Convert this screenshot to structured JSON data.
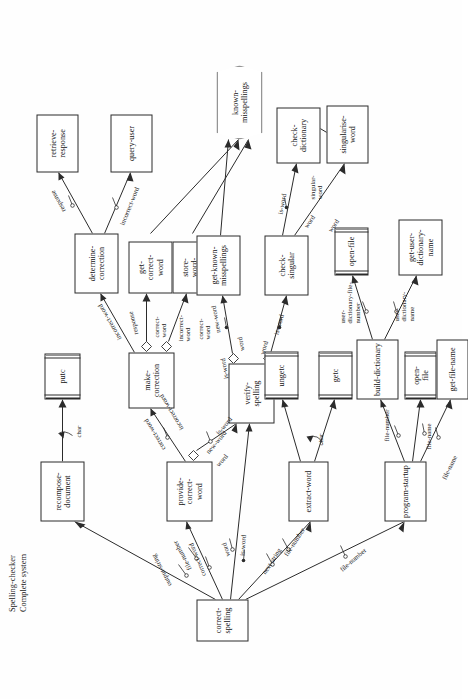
{
  "title": {
    "line1": "Spelling-checker",
    "line2": "Complete system"
  },
  "diagram": {
    "type": "structure-chart",
    "notation": "Yourdon/Constantine structure chart, rotated 90 degrees (landscape drawing on portrait page)",
    "root": "correct-spelling",
    "nodes": [
      {
        "id": "correct-spelling",
        "label": "correct-spelling",
        "kind": "module"
      },
      {
        "id": "recompose-document",
        "label": "recompose-\ndocument",
        "kind": "module"
      },
      {
        "id": "putc",
        "label": "putc",
        "kind": "library"
      },
      {
        "id": "provide-correct-word",
        "label": "provide-\ncorrect-\nword",
        "kind": "module"
      },
      {
        "id": "make-correction",
        "label": "make-\ncorrection",
        "kind": "module"
      },
      {
        "id": "determine-correction",
        "label": "determine-\ncorrection",
        "kind": "module"
      },
      {
        "id": "retrieve-response",
        "label": "retrieve-\nresponse",
        "kind": "module"
      },
      {
        "id": "query-user",
        "label": "query-user",
        "kind": "module"
      },
      {
        "id": "get-correct-word",
        "label": "get-\ncorrect-\nword",
        "kind": "module"
      },
      {
        "id": "store-word-pair",
        "label": "store-\nword-\npair",
        "kind": "module"
      },
      {
        "id": "verify-spelling",
        "label": "verify-\nspelling",
        "kind": "module"
      },
      {
        "id": "get-known-misspellings",
        "label": "get-known-\nmisspellings",
        "kind": "module"
      },
      {
        "id": "known-misspellings",
        "label": "known-\nmisspellings",
        "kind": "datastore"
      },
      {
        "id": "check-singular",
        "label": "check-\nsingular",
        "kind": "module"
      },
      {
        "id": "check-dictionary",
        "label": "check-\ndictionary",
        "kind": "module"
      },
      {
        "id": "singularise-word",
        "label": "singularise-\nword",
        "kind": "module"
      },
      {
        "id": "extract-word",
        "label": "extract-word",
        "kind": "module"
      },
      {
        "id": "ungetc",
        "label": "ungetc",
        "kind": "library"
      },
      {
        "id": "getc",
        "label": "getc",
        "kind": "library"
      },
      {
        "id": "program-startup",
        "label": "program-startup",
        "kind": "module"
      },
      {
        "id": "build-dictionary",
        "label": "build-dictionary",
        "kind": "module"
      },
      {
        "id": "open-file",
        "label": "open-\nfile",
        "kind": "library"
      },
      {
        "id": "open-dictionary",
        "label": "open-file",
        "kind": "library"
      },
      {
        "id": "get-user-dictionary-name",
        "label": "get-user-\ndictionary-\nname",
        "kind": "module"
      },
      {
        "id": "get-file-name",
        "label": "get-file-name",
        "kind": "module"
      }
    ],
    "edges": [
      {
        "from": "correct-spelling",
        "to": "recompose-document",
        "labels": [
          "output-string",
          "file-number"
        ]
      },
      {
        "from": "correct-spelling",
        "to": "provide-correct-word",
        "labels": [
          "correct-word",
          "word"
        ]
      },
      {
        "from": "correct-spelling",
        "to": "verify-spelling",
        "labels": [
          "is-word",
          "word"
        ]
      },
      {
        "from": "correct-spelling",
        "to": "extract-word",
        "labels": [
          "next-string",
          "file-number"
        ]
      },
      {
        "from": "correct-spelling",
        "to": "program-startup",
        "labels": [
          "file-number"
        ]
      },
      {
        "from": "recompose-document",
        "to": "putc",
        "labels": [
          "char"
        ]
      },
      {
        "from": "provide-correct-word",
        "to": "make-correction",
        "labels": [
          "correct-word",
          "incorrect-word"
        ]
      },
      {
        "from": "provide-correct-word",
        "to": "verify-spelling",
        "labels": [
          "new-word",
          "is-word",
          "word"
        ]
      },
      {
        "from": "make-correction",
        "to": "determine-correction",
        "labels": [
          "incorrect-word",
          "correct-word"
        ]
      },
      {
        "from": "make-correction",
        "to": "get-correct-word",
        "labels": [
          "correct-word",
          "response"
        ]
      },
      {
        "from": "make-correction",
        "to": "store-word-pair",
        "labels": [
          "incorrect-word",
          "correct-word"
        ]
      },
      {
        "from": "determine-correction",
        "to": "retrieve-response",
        "labels": [
          "response"
        ]
      },
      {
        "from": "determine-correction",
        "to": "query-user",
        "labels": [
          "incorrect-word"
        ]
      },
      {
        "from": "store-word-pair",
        "to": "known-misspellings",
        "labels": []
      },
      {
        "from": "get-correct-word",
        "to": "known-misspellings",
        "labels": []
      },
      {
        "from": "verify-spelling",
        "to": "get-known-misspellings",
        "labels": [
          "new-word",
          "is-word",
          "word"
        ]
      },
      {
        "from": "verify-spelling",
        "to": "check-singular",
        "labels": [
          "is-word",
          "word"
        ]
      },
      {
        "from": "get-known-misspellings",
        "to": "known-misspellings",
        "labels": []
      },
      {
        "from": "check-singular",
        "to": "check-dictionary",
        "labels": [
          "is-word",
          "word"
        ]
      },
      {
        "from": "check-singular",
        "to": "singularise-word",
        "labels": [
          "singular-word",
          "word"
        ]
      },
      {
        "from": "singularise-word",
        "to": "check-dictionary",
        "labels": [
          "singular-word"
        ]
      },
      {
        "from": "extract-word",
        "to": "ungetc",
        "labels": [
          "char"
        ]
      },
      {
        "from": "extract-word",
        "to": "getc",
        "labels": [
          "char"
        ]
      },
      {
        "from": "program-startup",
        "to": "build-dictionary",
        "labels": [
          "file-number"
        ]
      },
      {
        "from": "program-startup",
        "to": "open-file",
        "labels": [
          "file-name"
        ]
      },
      {
        "from": "program-startup",
        "to": "get-file-name",
        "labels": [
          "file-name"
        ]
      },
      {
        "from": "build-dictionary",
        "to": "open-dictionary",
        "labels": [
          "user-dictionary-file-number",
          "user-dictionary-name"
        ]
      },
      {
        "from": "build-dictionary",
        "to": "get-user-dictionary-name",
        "labels": [
          "user-dictionary-name"
        ]
      }
    ],
    "flow_labels": [
      "output-string",
      "file-number",
      "char",
      "correct-word",
      "word",
      "is-word",
      "next-string",
      "new-word",
      "incorrect-word",
      "response",
      "singular-word",
      "file-name",
      "user-dictionary-name",
      "user-dictionary-file-number"
    ]
  }
}
